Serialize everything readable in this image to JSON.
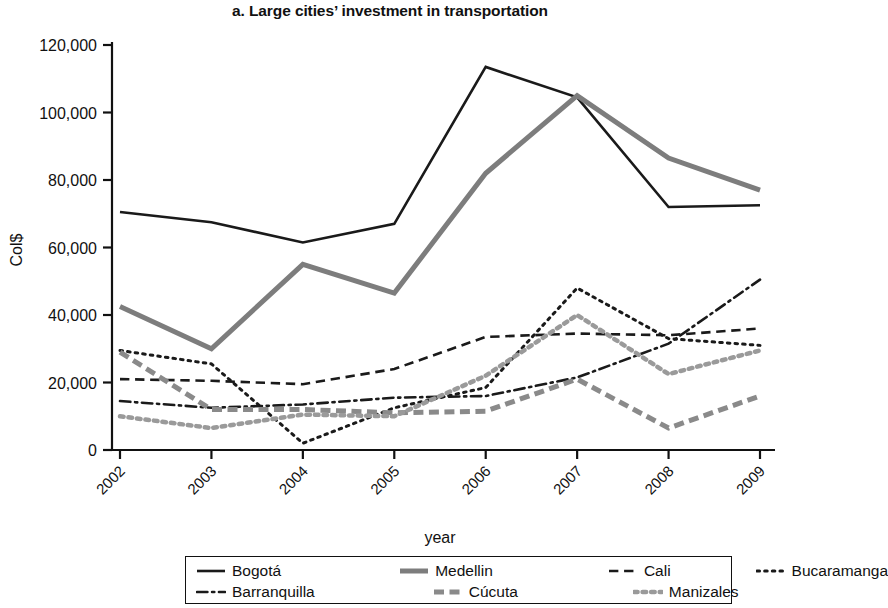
{
  "chart_data": {
    "type": "line",
    "title": "a. Large cities’ investment in transportation",
    "xlabel": "year",
    "ylabel": "Col$",
    "categories": [
      "2002",
      "2003",
      "2004",
      "2005",
      "2006",
      "2007",
      "2008",
      "2009"
    ],
    "x": [
      2002,
      2003,
      2004,
      2005,
      2006,
      2007,
      2008,
      2009
    ],
    "ylim": [
      0,
      120000
    ],
    "ytick_labels": [
      "0",
      "20,000",
      "40,000",
      "60,000",
      "80,000",
      "100,000",
      "120,000"
    ],
    "ytick_values": [
      0,
      20000,
      40000,
      60000,
      80000,
      100000,
      120000
    ],
    "grid": false,
    "legend_position": "bottom",
    "series": [
      {
        "name": "Bogotá",
        "style": "solid",
        "color": "#1a1a1a",
        "width": 2.6,
        "values": [
          70500,
          67500,
          61500,
          67000,
          113500,
          104500,
          72000,
          72500
        ]
      },
      {
        "name": "Medellin",
        "style": "solid",
        "color": "#7d7d7d",
        "width": 5.0,
        "values": [
          42500,
          30000,
          55000,
          46500,
          82000,
          105000,
          86500,
          77000
        ]
      },
      {
        "name": "Cali",
        "style": "dashed",
        "color": "#1a1a1a",
        "width": 2.6,
        "values": [
          21000,
          20500,
          19500,
          24000,
          33500,
          34500,
          34000,
          36000
        ]
      },
      {
        "name": "Bucaramanga",
        "style": "dotted",
        "color": "#1a1a1a",
        "width": 3.0,
        "values": [
          29500,
          25500,
          2000,
          12500,
          18500,
          48000,
          33000,
          31000
        ]
      },
      {
        "name": "Barranquilla",
        "style": "dashdot",
        "color": "#1a1a1a",
        "width": 2.6,
        "values": [
          14500,
          12500,
          13500,
          15500,
          16000,
          21500,
          31500,
          50500
        ]
      },
      {
        "name": "Cúcuta",
        "style": "dashed-thick",
        "color": "#8a8a8a",
        "width": 5.0,
        "values": [
          29000,
          12000,
          12000,
          11000,
          11500,
          21000,
          6500,
          16000
        ]
      },
      {
        "name": "Manizales",
        "style": "dotted-thick",
        "color": "#9a9a9a",
        "width": 4.5,
        "values": [
          10000,
          6500,
          10500,
          10000,
          22000,
          40000,
          22500,
          29500
        ]
      }
    ]
  },
  "legend": {
    "rows": [
      [
        {
          "label": "Bogotá",
          "series": 0
        },
        {
          "label": "Medellin",
          "series": 1
        },
        {
          "label": "Cali",
          "series": 2
        },
        {
          "label": "Bucaramanga",
          "series": 3
        }
      ],
      [
        {
          "label": "Barranquilla",
          "series": 4
        },
        {
          "label": "Cúcuta",
          "series": 5
        },
        {
          "label": "Manizales",
          "series": 6
        }
      ]
    ]
  }
}
